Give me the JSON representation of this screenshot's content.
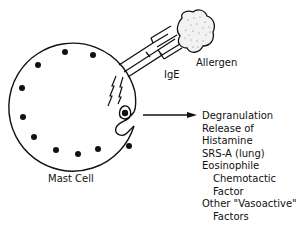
{
  "diagram": {
    "labels": {
      "allergen": "Allergen",
      "ige": "IgE",
      "cell": "Mast Cell"
    },
    "effects": [
      {
        "text": "Degranulation",
        "indent": false
      },
      {
        "text": "Release of",
        "indent": false
      },
      {
        "text": "Histamine",
        "indent": false
      },
      {
        "text": "SRS-A (lung)",
        "indent": false
      },
      {
        "text": "Eosinophile",
        "indent": false
      },
      {
        "text": "Chemotactic",
        "indent": true
      },
      {
        "text": "Factor",
        "indent": true
      },
      {
        "text": "Other \"Vasoactive\"",
        "indent": false
      },
      {
        "text": "Factors",
        "indent": true
      }
    ],
    "colors": {
      "ink": "#111111",
      "background": "#ffffff"
    }
  }
}
